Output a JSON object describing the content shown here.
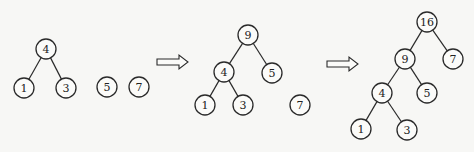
{
  "diagram": {
    "stages": [
      {
        "id": "stage-1",
        "nodes": [
          {
            "id": "s1-n4",
            "label": "4"
          },
          {
            "id": "s1-n1",
            "label": "1"
          },
          {
            "id": "s1-n3",
            "label": "3"
          },
          {
            "id": "s1-n5",
            "label": "5"
          },
          {
            "id": "s1-n7",
            "label": "7"
          }
        ],
        "edges": [
          [
            "s1-n4",
            "s1-n1"
          ],
          [
            "s1-n4",
            "s1-n3"
          ]
        ]
      },
      {
        "id": "stage-2",
        "nodes": [
          {
            "id": "s2-n9",
            "label": "9"
          },
          {
            "id": "s2-n4",
            "label": "4"
          },
          {
            "id": "s2-n5",
            "label": "5"
          },
          {
            "id": "s2-n1",
            "label": "1"
          },
          {
            "id": "s2-n3",
            "label": "3"
          },
          {
            "id": "s2-n7",
            "label": "7"
          }
        ],
        "edges": [
          [
            "s2-n9",
            "s2-n4"
          ],
          [
            "s2-n9",
            "s2-n5"
          ],
          [
            "s2-n4",
            "s2-n1"
          ],
          [
            "s2-n4",
            "s2-n3"
          ]
        ]
      },
      {
        "id": "stage-3",
        "nodes": [
          {
            "id": "s3-n16",
            "label": "16"
          },
          {
            "id": "s3-n9",
            "label": "9"
          },
          {
            "id": "s3-n7",
            "label": "7"
          },
          {
            "id": "s3-n4",
            "label": "4"
          },
          {
            "id": "s3-n5",
            "label": "5"
          },
          {
            "id": "s3-n1",
            "label": "1"
          },
          {
            "id": "s3-n3",
            "label": "3"
          }
        ],
        "edges": [
          [
            "s3-n16",
            "s3-n9"
          ],
          [
            "s3-n16",
            "s3-n7"
          ],
          [
            "s3-n9",
            "s3-n4"
          ],
          [
            "s3-n9",
            "s3-n5"
          ],
          [
            "s3-n4",
            "s3-n1"
          ],
          [
            "s3-n4",
            "s3-n3"
          ]
        ]
      }
    ],
    "transitions": [
      {
        "id": "arrow-1",
        "icon": "double-right-arrow-icon"
      },
      {
        "id": "arrow-2",
        "icon": "double-right-arrow-icon"
      }
    ]
  }
}
